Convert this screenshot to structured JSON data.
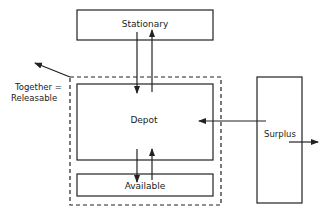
{
  "diagram": {
    "nodes": {
      "stationary": {
        "label": "Stationary"
      },
      "depot": {
        "label": "Depot"
      },
      "available": {
        "label": "Available"
      },
      "surplus": {
        "label": "Surplus"
      }
    },
    "group": {
      "label_line1": "Together =",
      "label_line2": "Releasable",
      "style": "dashed"
    },
    "edges": [
      {
        "from": "stationary",
        "to": "depot"
      },
      {
        "from": "depot",
        "to": "stationary"
      },
      {
        "from": "depot",
        "to": "available"
      },
      {
        "from": "available",
        "to": "depot"
      },
      {
        "from": "surplus",
        "to": "depot"
      },
      {
        "from": "surplus",
        "to": "outside"
      },
      {
        "from": "group",
        "to": "outside"
      }
    ],
    "colors": {
      "line": "#222222",
      "background": "#ffffff"
    }
  }
}
